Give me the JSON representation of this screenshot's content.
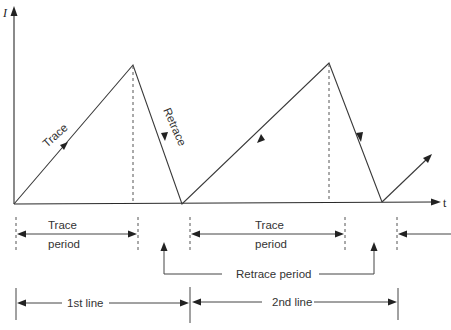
{
  "diagram": {
    "title_cut_off": true,
    "axes": {
      "y_label": "I",
      "x_label": "t"
    },
    "waveform": {
      "type": "sawtooth",
      "segment_labels": {
        "rising": "Trace",
        "falling": "Retrace"
      }
    },
    "annotations": {
      "trace_period_1": {
        "top": "Trace",
        "bottom": "period"
      },
      "trace_period_2": {
        "top": "Trace",
        "bottom": "period"
      },
      "retrace_period": "Retrace period",
      "line_1": "1st line",
      "line_2": "2nd line"
    }
  },
  "colors": {
    "line": "#3a3a3a",
    "text": "#333333",
    "background": "#ffffff"
  }
}
